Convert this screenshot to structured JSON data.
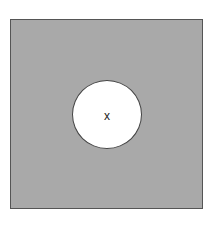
{
  "diagram": {
    "outer_shape": "square",
    "inner_shape": "circle",
    "center_label": "x",
    "colors": {
      "square_fill": "#a9a9a9",
      "square_border": "#555555",
      "circle_fill": "#ffffff",
      "circle_border": "#444444",
      "label": "#222222"
    }
  }
}
